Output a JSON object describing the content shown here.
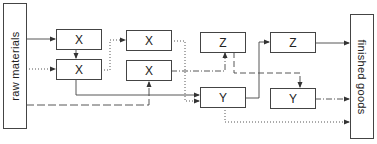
{
  "diagram": {
    "source_label": "raw materials",
    "sink_label": "finished goods",
    "nodes": [
      {
        "id": "x1",
        "label": "X"
      },
      {
        "id": "x2",
        "label": "X"
      },
      {
        "id": "x3",
        "label": "X"
      },
      {
        "id": "x4",
        "label": "X"
      },
      {
        "id": "z1",
        "label": "Z"
      },
      {
        "id": "y1",
        "label": "Y"
      },
      {
        "id": "z2",
        "label": "Z"
      },
      {
        "id": "y2",
        "label": "Y"
      }
    ],
    "edges": [
      {
        "from": "raw materials",
        "to": "x1",
        "style": "solid"
      },
      {
        "from": "raw materials",
        "to": "x2",
        "style": "dotted"
      },
      {
        "from": "raw materials",
        "to": "x4",
        "style": "dashed"
      },
      {
        "from": "x1",
        "to": "x2",
        "style": "solid"
      },
      {
        "from": "x2",
        "to": "x3",
        "style": "dotted"
      },
      {
        "from": "x2",
        "to": "y1",
        "style": "solid"
      },
      {
        "from": "x3",
        "to": "y1",
        "style": "dotted"
      },
      {
        "from": "x4",
        "to": "z1",
        "style": "dash-dot"
      },
      {
        "from": "z1",
        "to": "y2",
        "style": "dashed"
      },
      {
        "from": "y1",
        "to": "z2",
        "style": "solid"
      },
      {
        "from": "y1",
        "to": "finished goods",
        "style": "dotted"
      },
      {
        "from": "z2",
        "to": "finished goods",
        "style": "solid"
      },
      {
        "from": "y2",
        "to": "finished goods",
        "style": "dash-dot"
      }
    ]
  }
}
